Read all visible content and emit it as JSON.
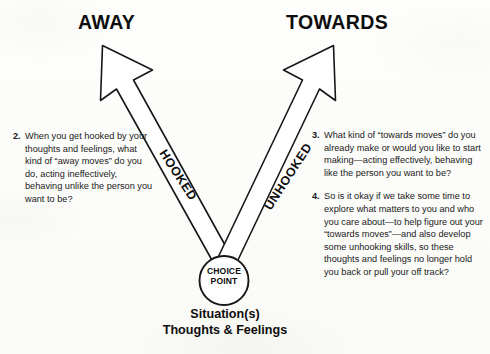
{
  "diagram": {
    "title_left": "AWAY",
    "title_right": "TOWARDS",
    "path_label_left": "HOOKED",
    "path_label_right": "UNHOOKED",
    "center_node": {
      "line1": "CHOICE",
      "line2": "POINT"
    },
    "caption": {
      "line1": "Situation(s)",
      "line2": "Thoughts & Feelings"
    },
    "colors": {
      "ink": "#171717",
      "text": "#191919",
      "paper": "#fdfdfb"
    }
  },
  "prompts": {
    "left": [
      {
        "number": "2.",
        "text": "When you get hooked by your thoughts and feelings, what kind of “away moves” do you do, acting ineffectively, behaving unlike the person you want to be?"
      }
    ],
    "right": [
      {
        "number": "3.",
        "text": "What kind of “towards moves” do you already make or would you like to start making—acting effectively, behaving like the person you want to be?"
      },
      {
        "number": "4.",
        "text": "So is it okay if we take some time to explore what matters to you and who you care about—to help figure out your “towards moves”—and also develop some unhooking skills, so these thoughts and feelings no longer hold you back or pull your off track?"
      }
    ]
  }
}
